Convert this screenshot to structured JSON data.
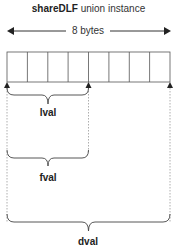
{
  "title": {
    "bold": "shareDLF",
    "rest": " union instance"
  },
  "size_label": "8 bytes",
  "cells": 8,
  "members": [
    {
      "name": "lval",
      "span_bytes": 4
    },
    {
      "name": "fval",
      "span_bytes": 4
    },
    {
      "name": "dval",
      "span_bytes": 8
    }
  ],
  "colors": {
    "line": "#333333",
    "cell_border": "#555555",
    "dotted": "#999999"
  }
}
